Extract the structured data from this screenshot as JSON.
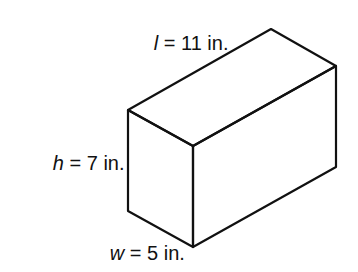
{
  "figure": {
    "type": "rectangular-prism",
    "stroke_color": "#111111",
    "background": "#ffffff",
    "vertices": {
      "left_top": [
        128,
        110
      ],
      "back_top": [
        271,
        29
      ],
      "right_top": [
        336,
        66
      ],
      "front_top": [
        193,
        146
      ],
      "left_bottom": [
        128,
        211
      ],
      "front_bottom": [
        193,
        247
      ],
      "right_bottom": [
        336,
        167
      ]
    },
    "labels": {
      "length": {
        "variable": "l",
        "equals": " = ",
        "value": "11",
        "unit": " in.",
        "full": "l = 11 in."
      },
      "height": {
        "variable": "h",
        "equals": " = ",
        "value": "7",
        "unit": " in.",
        "full": "h = 7 in."
      },
      "width": {
        "variable": "w",
        "equals": " = ",
        "value": "5",
        "unit": " in.",
        "full": "w = 5 in."
      }
    }
  }
}
